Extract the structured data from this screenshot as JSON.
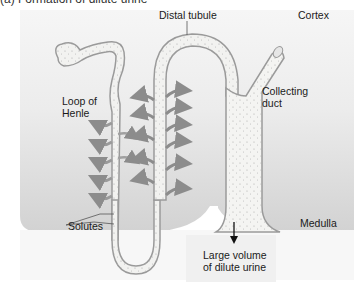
{
  "figure": {
    "cutoff_top_text": "(a) Formation of dilute urine",
    "labels": {
      "distal_tubule": "Distal tubule",
      "cortex": "Cortex",
      "loop_of_henle": "Loop of\nHenle",
      "collecting_duct": "Collecting\nduct",
      "solutes": "Solutes",
      "medulla": "Medulla",
      "output": "Large volume\nof dilute urine"
    },
    "regions": [
      "Cortex",
      "Medulla"
    ],
    "colors": {
      "background": "#ffffff",
      "cortex_top": "#f3f3f3",
      "cortex_bottom": "#d6d6d6",
      "medulla": "#cfcfcf",
      "tubule_fill": "#f2f2f0",
      "tubule_outline": "#9a9a9a",
      "arrow": "#8c8c8c",
      "text": "#1a1a1a"
    }
  }
}
